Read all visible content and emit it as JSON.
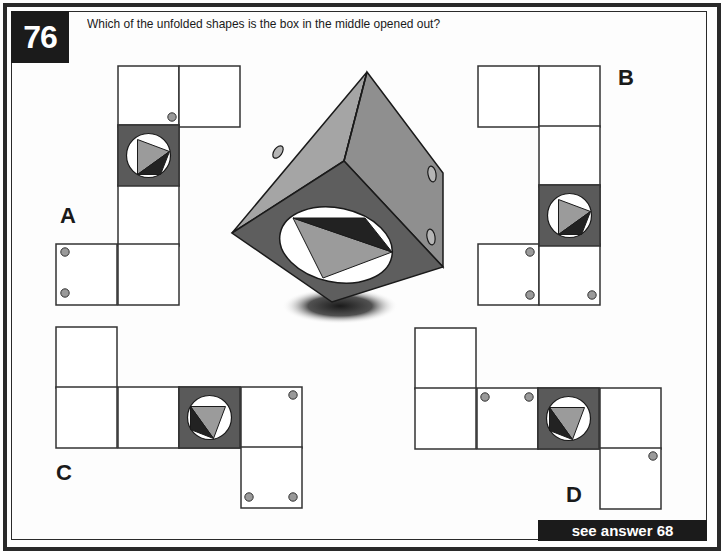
{
  "question": {
    "number": "76",
    "text": "Which of the unfolded shapes is the box in the middle opened out?"
  },
  "answer_link": "see answer 68",
  "colors": {
    "frame": "#2a2a2a",
    "cell_stroke": "#333333",
    "dark_face": "#5a5a5a",
    "dot": "#9a9a9a",
    "light_triangle": "#9b9b9b",
    "dark_triangle": "#222222",
    "cube_top_left": "#a5a5a5",
    "cube_top_right": "#8f8f8f",
    "cube_front": "#5e5e5e"
  },
  "cell_size": 61,
  "options": [
    {
      "label": "A",
      "label_pos": [
        60,
        203
      ],
      "cells": [
        [
          118,
          66
        ],
        [
          179,
          66
        ],
        [
          118,
          125
        ],
        [
          118,
          185
        ],
        [
          56,
          244
        ],
        [
          118,
          244
        ]
      ],
      "dark_cell": [
        118,
        125
      ],
      "symbol_rotation": 0,
      "dots": [
        [
          172,
          117
        ],
        [
          65,
          252
        ],
        [
          65,
          293
        ]
      ]
    },
    {
      "label": "B",
      "label_pos": [
        618,
        65
      ],
      "cells": [
        [
          478,
          66
        ],
        [
          539,
          66
        ],
        [
          539,
          126
        ],
        [
          539,
          185
        ],
        [
          478,
          244
        ],
        [
          539,
          244
        ]
      ],
      "dark_cell": [
        539,
        185
      ],
      "symbol_rotation": 0,
      "dots": [
        [
          530,
          252
        ],
        [
          530,
          295
        ],
        [
          592,
          295
        ]
      ]
    },
    {
      "label": "C",
      "label_pos": [
        56,
        460
      ],
      "cells": [
        [
          56,
          327
        ],
        [
          56,
          387
        ],
        [
          118,
          387
        ],
        [
          179,
          387
        ],
        [
          241,
          387
        ],
        [
          241,
          447
        ]
      ],
      "dark_cell": [
        179,
        387
      ],
      "symbol_rotation": 90,
      "dots": [
        [
          293,
          395
        ],
        [
          249,
          497
        ],
        [
          293,
          497
        ]
      ]
    },
    {
      "label": "D",
      "label_pos": [
        566,
        482
      ],
      "cells": [
        [
          415,
          328
        ],
        [
          415,
          388
        ],
        [
          477,
          388
        ],
        [
          538,
          388
        ],
        [
          600,
          388
        ],
        [
          600,
          448
        ]
      ],
      "dark_cell": [
        538,
        388
      ],
      "symbol_rotation": 90,
      "dots": [
        [
          485,
          397
        ],
        [
          529,
          397
        ],
        [
          653,
          456
        ]
      ]
    }
  ],
  "cube": {
    "vertices": {
      "top": [
        367,
        72
      ],
      "left": [
        232,
        233
      ],
      "center": [
        344,
        161
      ],
      "right_top": [
        443,
        173
      ],
      "right_bottom": [
        443,
        267
      ],
      "bottom": [
        332,
        302
      ]
    },
    "hole": {
      "cx": 336,
      "cy": 245,
      "rx": 57,
      "ry": 37,
      "rotate": 12
    },
    "light_triangle": [
      [
        293,
        218
      ],
      [
        392,
        252
      ],
      [
        323,
        278
      ]
    ],
    "dark_triangle": [
      [
        293,
        218
      ],
      [
        365,
        218
      ],
      [
        392,
        252
      ]
    ],
    "side_holes": [
      {
        "cx": 278,
        "cy": 152,
        "rx": 4,
        "ry": 7,
        "rotate": 35
      },
      {
        "cx": 432,
        "cy": 174,
        "rx": 4,
        "ry": 8,
        "rotate": -10
      },
      {
        "cx": 431,
        "cy": 237,
        "rx": 4,
        "ry": 8,
        "rotate": -10
      }
    ],
    "shadow": {
      "cx": 340,
      "cy": 306,
      "rx": 58,
      "ry": 18
    }
  }
}
